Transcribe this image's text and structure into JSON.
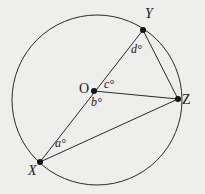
{
  "diagram": {
    "type": "circle-geometry",
    "colors": {
      "background": "#eeeeec",
      "stroke": "#2a2a2a",
      "point": "#111111"
    },
    "circle": {
      "center": "O",
      "cx": 97,
      "cy": 100,
      "r": 85
    },
    "points": [
      {
        "id": "Y",
        "label": "Y",
        "x": 143,
        "y": 30
      },
      {
        "id": "O",
        "label": "O",
        "x": 94,
        "y": 91
      },
      {
        "id": "Z",
        "label": "Z",
        "x": 178,
        "y": 99
      },
      {
        "id": "X",
        "label": "X",
        "x": 40,
        "y": 162
      }
    ],
    "segments": [
      {
        "from": "X",
        "to": "Y",
        "note": "diameter through O"
      },
      {
        "from": "O",
        "to": "Z"
      },
      {
        "from": "Y",
        "to": "Z"
      },
      {
        "from": "X",
        "to": "Z"
      }
    ],
    "angles": [
      {
        "id": "a",
        "label": "a°",
        "vertex": "X"
      },
      {
        "id": "b",
        "label": "b°",
        "vertex": "O"
      },
      {
        "id": "c",
        "label": "c°",
        "vertex": "O"
      },
      {
        "id": "d",
        "label": "d°",
        "vertex": "Y"
      }
    ]
  }
}
